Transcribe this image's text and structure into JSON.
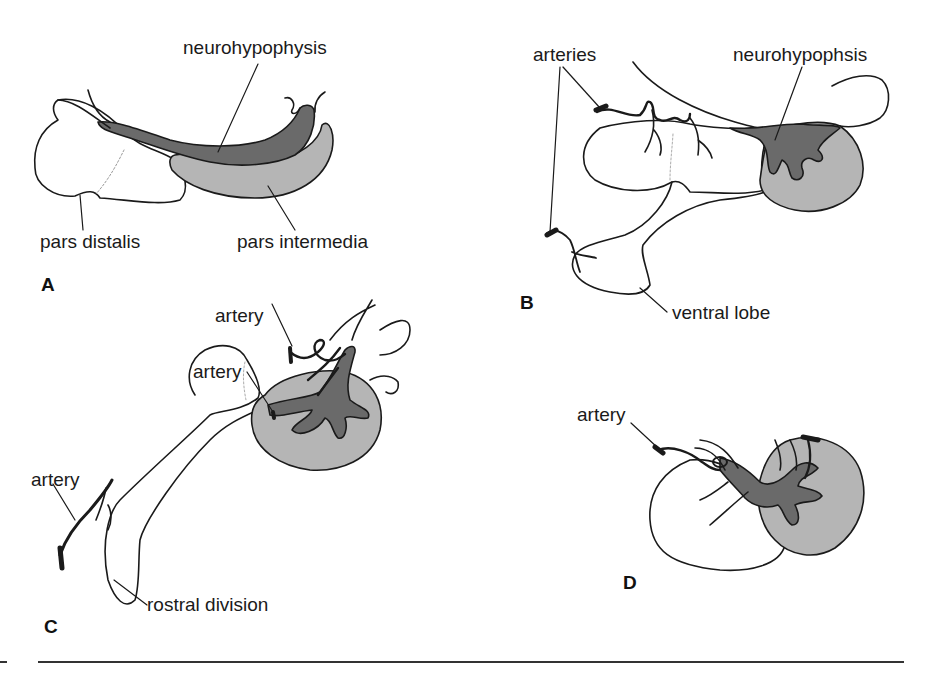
{
  "figure": {
    "colors": {
      "outline": "#1a1a1a",
      "neuro_dark": "#6a6a6a",
      "intermedia_light": "#b5b5b5",
      "background": "#ffffff"
    },
    "panels": [
      {
        "id": "A",
        "letter": "A",
        "labels": {
          "neurohypophysis": "neurohypophysis",
          "pars_distalis": "pars distalis",
          "pars_intermedia": "pars intermedia"
        }
      },
      {
        "id": "B",
        "letter": "B",
        "labels": {
          "arteries": "arteries",
          "neurohypophsis": "neurohypophsis",
          "ventral_lobe": "ventral lobe"
        }
      },
      {
        "id": "C",
        "letter": "C",
        "labels": {
          "artery_top": "artery",
          "artery_mid": "artery",
          "artery_left": "artery",
          "rostral_division": "rostral division"
        }
      },
      {
        "id": "D",
        "letter": "D",
        "labels": {
          "artery": "artery"
        }
      }
    ]
  }
}
